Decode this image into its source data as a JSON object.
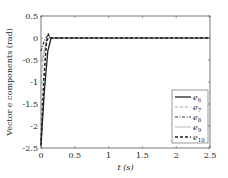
{
  "chart_data": {
    "type": "line",
    "title": "",
    "xlabel": "t (s)",
    "ylabel": "Vector e components (rad)",
    "xlim": [
      0,
      2.5
    ],
    "ylim": [
      -2.5,
      0.5
    ],
    "xticks": [
      "0",
      "0.5",
      "1",
      "1.5",
      "2",
      "2.5"
    ],
    "yticks": [
      "0.5",
      "0",
      "-0.5",
      "-1",
      "-1.5",
      "-2",
      "-2.5"
    ],
    "grid": false,
    "legend_position": "lower right",
    "series": [
      {
        "name": "e6",
        "style": "solid",
        "color": "#222222",
        "x": [
          0,
          0.05,
          0.1,
          0.15,
          0.2,
          2.5
        ],
        "y": [
          -2.4,
          -1.2,
          -0.3,
          0.0,
          0.0,
          0.0
        ]
      },
      {
        "name": "e7",
        "style": "dashed",
        "color": "#999999",
        "x": [
          0,
          0.04,
          0.08,
          0.12,
          0.2,
          2.5
        ],
        "y": [
          -0.9,
          -0.4,
          -0.05,
          0.0,
          0.0,
          0.0
        ]
      },
      {
        "name": "e8",
        "style": "dashdot",
        "color": "#333333",
        "x": [
          0,
          0.03,
          0.07,
          0.1,
          0.15,
          2.5
        ],
        "y": [
          -0.3,
          -0.15,
          0.0,
          0.05,
          0.0,
          0.0
        ]
      },
      {
        "name": "e9",
        "style": "solid",
        "color": "#aaaaaa",
        "x": [
          0,
          0.04,
          0.09,
          0.14,
          0.2,
          2.5
        ],
        "y": [
          -0.6,
          -0.3,
          -0.05,
          0.0,
          0.0,
          0.0
        ]
      },
      {
        "name": "e10",
        "style": "dashed-thick",
        "color": "#222222",
        "x": [
          0,
          0.04,
          0.08,
          0.11,
          0.15,
          2.5
        ],
        "y": [
          -2.45,
          -1.0,
          -0.1,
          0.08,
          0.0,
          0.0
        ]
      }
    ]
  },
  "legend": {
    "items": [
      {
        "base": "e",
        "sub": "6"
      },
      {
        "base": "e",
        "sub": "7"
      },
      {
        "base": "e",
        "sub": "8"
      },
      {
        "base": "e",
        "sub": "9"
      },
      {
        "base": "e",
        "sub": "10"
      }
    ]
  }
}
